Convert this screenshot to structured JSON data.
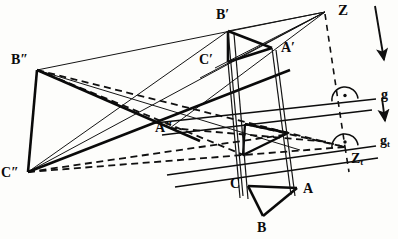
{
  "figure": {
    "type": "geometry-diagram",
    "width": 398,
    "height": 239,
    "ink_color": "#0d0d0d",
    "paper_color": "#fdfdfb"
  },
  "labels": {
    "Z": "Z",
    "Zt": "Z",
    "Zt_sub": "t",
    "g": "g",
    "gt": "g",
    "gt_sub": "t",
    "A": "A",
    "B": "B",
    "C": "C",
    "Ap": "A′",
    "Bp": "B′",
    "Cp": "C′",
    "App": "A″",
    "Bpp": "B″",
    "Cpp": "C″"
  },
  "points": {
    "Z": {
      "x": 325,
      "y": 12,
      "label": "Z"
    },
    "Zt": {
      "x": 345,
      "y": 147,
      "label": "Zt"
    },
    "Ap": {
      "x": 272,
      "y": 48,
      "label": "A′"
    },
    "Bp": {
      "x": 228,
      "y": 31,
      "label": "B′"
    },
    "Cp": {
      "x": 228,
      "y": 62,
      "label": "C′"
    },
    "A": {
      "x": 297,
      "y": 188,
      "label": "A"
    },
    "B": {
      "x": 263,
      "y": 216,
      "label": "B"
    },
    "C": {
      "x": 248,
      "y": 186,
      "label": "C"
    },
    "App": {
      "x": 170,
      "y": 128,
      "label": "A″"
    },
    "Bpp": {
      "x": 37,
      "y": 70,
      "label": "B″"
    },
    "Cpp": {
      "x": 28,
      "y": 172,
      "label": "C″"
    },
    "At": {
      "x": 288,
      "y": 133,
      "label": ""
    },
    "Bt": {
      "x": 243,
      "y": 155,
      "label": ""
    },
    "Ct": {
      "x": 245,
      "y": 124,
      "label": ""
    }
  },
  "lines": {
    "g": {
      "x1": 155,
      "y1": 123,
      "x2": 376,
      "y2": 99,
      "style": "solid",
      "label": "g"
    },
    "gt": {
      "x1": 167,
      "y1": 175,
      "x2": 376,
      "y2": 146,
      "style": "solid",
      "label": "gt"
    },
    "g_aux": {
      "x1": 162,
      "y1": 135,
      "x2": 372,
      "y2": 110,
      "style": "solid"
    },
    "gt_aux": {
      "x1": 175,
      "y1": 187,
      "x2": 378,
      "y2": 158,
      "style": "solid"
    }
  },
  "markers": {
    "right_angle_g": {
      "cx": 345,
      "cy": 102,
      "r": 13,
      "dot": true
    },
    "right_angle_gt": {
      "cx": 345,
      "cy": 147,
      "r": 13,
      "dot": true
    }
  },
  "arrows": [
    {
      "name": "arrow-upper",
      "x1": 375,
      "y1": 6,
      "x2": 384,
      "y2": 62
    },
    {
      "name": "arrow-lower",
      "x1": 382,
      "y1": 98,
      "x2": 385,
      "y2": 124
    }
  ],
  "label_positions": {
    "Z": {
      "x": 338,
      "y": 4
    },
    "Zt": {
      "x": 352,
      "y": 154
    },
    "g": {
      "x": 381,
      "y": 90
    },
    "gt": {
      "x": 381,
      "y": 136
    },
    "Ap": {
      "x": 281,
      "y": 48
    },
    "Bp": {
      "x": 216,
      "y": 10
    },
    "Cp": {
      "x": 200,
      "y": 54
    },
    "A": {
      "x": 302,
      "y": 183
    },
    "B": {
      "x": 257,
      "y": 222
    },
    "C": {
      "x": 230,
      "y": 178
    },
    "App": {
      "x": 157,
      "y": 124
    },
    "Bpp": {
      "x": 11,
      "y": 55
    },
    "Cpp": {
      "x": 2,
      "y": 167
    }
  }
}
